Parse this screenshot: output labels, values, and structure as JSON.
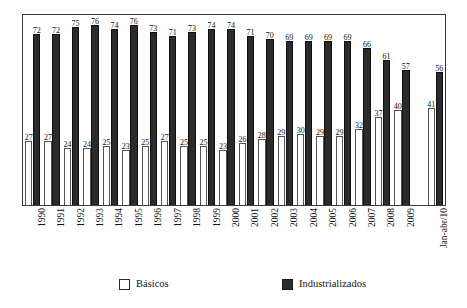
{
  "chart_data": {
    "type": "bar",
    "title": "",
    "subtitle": "",
    "xlabel": "",
    "ylabel": "",
    "grid": false,
    "legend_position": "bottom",
    "ylim": [
      0,
      80
    ],
    "categories": [
      "1990",
      "1991",
      "1992",
      "1993",
      "1994",
      "1995",
      "1996",
      "1997",
      "1998",
      "1999",
      "2000",
      "2001",
      "2002",
      "2003",
      "2004",
      "2005",
      "2006",
      "2007",
      "2008",
      "2009",
      "Jan-abr/10"
    ],
    "series": [
      {
        "name": "Básicos",
        "color": "#ffffff",
        "values": [
          27,
          27,
          24,
          24,
          25,
          23,
          25,
          27,
          25,
          25,
          23,
          26,
          28,
          29,
          30,
          29,
          29,
          32,
          37,
          40,
          41
        ]
      },
      {
        "name": "Industrializados",
        "color": "#2b2b2b",
        "values": [
          72,
          72,
          75,
          76,
          74,
          76,
          73,
          71,
          73,
          74,
          74,
          71,
          70,
          69,
          69,
          69,
          69,
          66,
          61,
          57,
          56
        ]
      }
    ]
  },
  "legend": {
    "entries": [
      {
        "label": "Básicos",
        "swatch": "white-square"
      },
      {
        "label": "Industrializados",
        "swatch": "dark-square"
      }
    ]
  }
}
